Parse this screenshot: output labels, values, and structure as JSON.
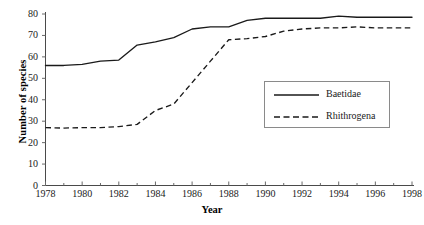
{
  "chart_data": {
    "type": "line",
    "title": "",
    "xlabel": "Year",
    "ylabel": "Number of species",
    "xlim": [
      1978,
      1998
    ],
    "ylim": [
      0,
      80
    ],
    "ytick_step": 10,
    "xtick_step_major": 2,
    "xtick_step_minor": 1,
    "grid": false,
    "legend_position": "center-right",
    "x": [
      1978,
      1979,
      1980,
      1981,
      1982,
      1983,
      1984,
      1985,
      1986,
      1987,
      1988,
      1989,
      1990,
      1991,
      1992,
      1993,
      1994,
      1995,
      1996,
      1997,
      1998
    ],
    "series": [
      {
        "name": "Baetidae",
        "style": "solid",
        "color": "#1a1a1a",
        "values": [
          56,
          56,
          56.5,
          58,
          58.5,
          65.5,
          67,
          69,
          73,
          74,
          74,
          77,
          78,
          78,
          78,
          78,
          79,
          78.5,
          78.5,
          78.5,
          78.5
        ]
      },
      {
        "name": "Rhithrogena",
        "style": "dashed",
        "color": "#1a1a1a",
        "values": [
          27,
          26.8,
          27,
          27,
          27.5,
          28.5,
          35,
          38,
          48,
          58,
          68,
          68.5,
          69.5,
          72,
          73,
          73.5,
          73.5,
          74,
          73.5,
          73.5,
          73.5
        ]
      }
    ],
    "ytick_labels": [
      "0",
      "10",
      "20",
      "30",
      "40",
      "50",
      "60",
      "70",
      "80"
    ],
    "xtick_labels": [
      "1978",
      "1980",
      "1982",
      "1984",
      "1986",
      "1988",
      "1990",
      "1992",
      "1994",
      "1996",
      "1998"
    ]
  },
  "axes": {
    "x_title": "Year",
    "y_title": "Number of species"
  },
  "legend": {
    "entries": [
      {
        "label": "Baetidae",
        "style": "solid"
      },
      {
        "label": "Rhithrogena",
        "style": "dashed"
      }
    ]
  }
}
